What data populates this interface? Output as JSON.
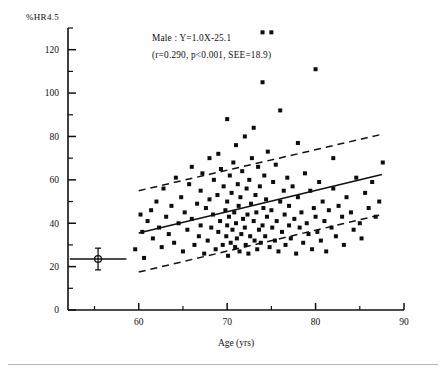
{
  "figure": {
    "name": "scatter-regression-hr45-vs-age",
    "background": "#fefefe",
    "point_color": "#0d0d0d",
    "line_color": "#111111"
  },
  "annotation": {
    "line1": "Male : Y=1.0X-25.1",
    "line2": "(r=0.290,  p<0.001,  SEE=18.9)"
  },
  "axes": {
    "y_caption": "%HR4.5",
    "x_title": "Age (yrs)",
    "x_ticks": [
      "60",
      "70",
      "80",
      "90"
    ],
    "y_ticks": [
      "0",
      "20",
      "40",
      "60",
      "80",
      "100",
      "120"
    ]
  },
  "chart_data": {
    "type": "scatter",
    "title": "",
    "subtitle": "",
    "xlabel": "Age (yrs)",
    "ylabel": "%HR4.5",
    "xlim": [
      52,
      90
    ],
    "ylim": [
      0,
      130
    ],
    "xticks": [
      60,
      70,
      80,
      90
    ],
    "xticks_minor": [
      55,
      65,
      75,
      85
    ],
    "yticks": [
      0,
      20,
      40,
      60,
      80,
      100,
      120
    ],
    "yticks_minor": [
      10,
      30,
      50,
      70,
      90,
      110,
      130
    ],
    "grid": false,
    "legend": "none",
    "annotations": [
      {
        "text": "Male : Y=1.0X-25.1",
        "x": 61.5,
        "y": 124
      },
      {
        "text": "(r=0.290,  p<0.001,  SEE=18.9)",
        "x": 61.5,
        "y": 116
      }
    ],
    "statistics": {
      "group": "Male",
      "slope": 1.0,
      "intercept": -25.1,
      "r": 0.29,
      "p": "<0.001",
      "SEE": 18.9,
      "equation": "Y=1.0X-25.1"
    },
    "series": [
      {
        "name": "Male subjects",
        "marker": "square",
        "x": [
          59.6,
          60.2,
          60.4,
          60.6,
          61.0,
          61.4,
          61.6,
          62.0,
          62.3,
          62.6,
          62.8,
          63.1,
          63.4,
          63.7,
          64.0,
          64.2,
          64.5,
          64.8,
          65.0,
          65.2,
          65.5,
          65.7,
          66.0,
          66.0,
          66.3,
          66.6,
          66.8,
          67.0,
          67.0,
          67.2,
          67.4,
          67.6,
          67.8,
          68.0,
          68.0,
          68.2,
          68.4,
          68.5,
          68.7,
          68.9,
          69.0,
          69.0,
          69.2,
          69.3,
          69.5,
          69.6,
          69.8,
          69.9,
          70.0,
          70.0,
          70.0,
          70.1,
          70.2,
          70.3,
          70.4,
          70.5,
          70.6,
          70.7,
          70.8,
          70.9,
          71.0,
          71.0,
          71.1,
          71.2,
          71.3,
          71.4,
          71.5,
          71.6,
          71.7,
          71.8,
          72.0,
          72.0,
          72.1,
          72.2,
          72.3,
          72.4,
          72.5,
          72.6,
          72.7,
          72.8,
          73.0,
          73.0,
          73.1,
          73.2,
          73.3,
          73.4,
          73.5,
          73.6,
          73.7,
          73.8,
          74.0,
          74.0,
          74.0,
          74.1,
          74.2,
          74.3,
          74.4,
          74.5,
          74.6,
          74.8,
          75.0,
          75.0,
          75.1,
          75.2,
          75.4,
          75.5,
          75.6,
          75.8,
          76.0,
          76.0,
          76.2,
          76.4,
          76.5,
          76.6,
          76.8,
          77.0,
          77.0,
          77.2,
          77.4,
          77.6,
          77.8,
          78.0,
          78.0,
          78.2,
          78.4,
          78.6,
          78.8,
          79.0,
          79.2,
          79.4,
          79.6,
          79.8,
          80.0,
          80.0,
          80.2,
          80.4,
          80.6,
          80.8,
          81.0,
          81.2,
          81.5,
          81.8,
          82.0,
          82.0,
          82.3,
          82.6,
          83.0,
          83.2,
          83.5,
          84.0,
          84.3,
          84.6,
          85.0,
          85.2,
          85.6,
          86.0,
          86.4,
          86.8,
          87.2,
          87.6
        ],
        "y": [
          28,
          44,
          36,
          24,
          41,
          46,
          33,
          50,
          38,
          29,
          56,
          43,
          35,
          48,
          31,
          61,
          40,
          52,
          27,
          45,
          37,
          58,
          42,
          66,
          30,
          49,
          34,
          55,
          39,
          63,
          26,
          47,
          32,
          51,
          70,
          38,
          44,
          60,
          28,
          53,
          36,
          72,
          41,
          65,
          30,
          57,
          46,
          34,
          39,
          50,
          88,
          25,
          43,
          62,
          31,
          54,
          37,
          68,
          45,
          29,
          40,
          76,
          33,
          58,
          48,
          27,
          52,
          35,
          64,
          42,
          38,
          80,
          30,
          56,
          44,
          26,
          60,
          34,
          49,
          70,
          41,
          84,
          32,
          53,
          45,
          28,
          66,
          37,
          57,
          31,
          39,
          128,
          105,
          47,
          62,
          34,
          51,
          43,
          73,
          29,
          128,
          46,
          38,
          59,
          32,
          67,
          41,
          27,
          50,
          92,
          36,
          55,
          44,
          30,
          61,
          39,
          48,
          33,
          57,
          42,
          26,
          52,
          77,
          38,
          45,
          31,
          63,
          40,
          35,
          55,
          28,
          47,
          43,
          111,
          36,
          59,
          32,
          50,
          41,
          27,
          46,
          38,
          56,
          70,
          34,
          48,
          43,
          30,
          52,
          45,
          37,
          61,
          40,
          33,
          54,
          47,
          59,
          43,
          50,
          68
        ]
      }
    ],
    "regression_line": {
      "style": "solid",
      "points": [
        [
          60,
          35.5
        ],
        [
          87.5,
          62.5
        ]
      ]
    },
    "confidence_bands": [
      {
        "name": "upper-band",
        "style": "dashed",
        "points": [
          [
            60,
            55.0
          ],
          [
            87.5,
            81.0
          ]
        ]
      },
      {
        "name": "lower-band",
        "style": "dashed",
        "points": [
          [
            60,
            17.5
          ],
          [
            87.5,
            44.0
          ]
        ]
      }
    ],
    "marker_overlay": {
      "name": "mean-sd-marker",
      "x": 55.4,
      "y": 23.5,
      "x_half_width": 3.2,
      "y_half_height": 5.0,
      "shape": "circle-with-crosshair"
    }
  }
}
